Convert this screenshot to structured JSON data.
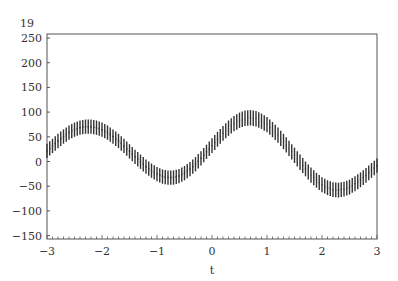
{
  "chart_data": {
    "type": "scatter",
    "title": "19",
    "xlabel": "t",
    "ylabel": "",
    "xlim": [
      -3,
      3
    ],
    "ylim": [
      -155,
      260
    ],
    "x_ticks": [
      -3,
      -2,
      -1,
      0,
      1,
      2,
      3
    ],
    "x_tick_labels": [
      "−3",
      "−2",
      "−1",
      "0",
      "1",
      "2",
      "3"
    ],
    "y_ticks": [
      250,
      200,
      150,
      100,
      50,
      0,
      -50,
      -100,
      -150
    ],
    "y_tick_labels": [
      "250",
      "200",
      "150",
      "100",
      "50",
      "0",
      "−50",
      "−100",
      "−150"
    ],
    "grid": false,
    "legend": null,
    "error_bars": true,
    "error_half_width": 8,
    "x": [
      -3.0,
      -2.9,
      -2.8,
      -2.7,
      -2.6,
      -2.5,
      -2.4,
      -2.3,
      -2.2,
      -2.1,
      -2.0,
      -1.9,
      -1.8,
      -1.7,
      -1.6,
      -1.5,
      -1.4,
      -1.3,
      -1.2,
      -1.1,
      -1.0,
      -0.9,
      -0.8,
      -0.7,
      -0.6,
      -0.5,
      -0.4,
      -0.3,
      -0.2,
      -0.1,
      0.0,
      0.1,
      0.2,
      0.3,
      0.4,
      0.5,
      0.6,
      0.7,
      0.8,
      0.9,
      1.0,
      1.1,
      1.2,
      1.3,
      1.4,
      1.5,
      1.6,
      1.7,
      1.8,
      1.9,
      2.0,
      2.1,
      2.2,
      2.3,
      2.4,
      2.5,
      2.6,
      2.7,
      2.8,
      2.9,
      3.0
    ],
    "series": [
      {
        "name": "upper",
        "values": [
          28,
          38,
          48,
          57,
          65,
          71,
          75,
          77,
          77,
          75,
          71,
          65,
          57,
          48,
          38,
          27,
          16,
          6,
          -4,
          -12,
          -19,
          -24,
          -26,
          -26,
          -23,
          -17,
          -9,
          1,
          13,
          26,
          39,
          52,
          64,
          75,
          84,
          91,
          95,
          96,
          94,
          89,
          82,
          72,
          61,
          48,
          34,
          20,
          6,
          -8,
          -20,
          -31,
          -40,
          -46,
          -50,
          -51,
          -49,
          -45,
          -38,
          -30,
          -21,
          -11,
          -2
        ]
      },
      {
        "name": "lower",
        "values": [
          15,
          25,
          35,
          44,
          52,
          58,
          62,
          64,
          64,
          62,
          58,
          52,
          44,
          35,
          25,
          14,
          3,
          -7,
          -17,
          -25,
          -32,
          -37,
          -39,
          -39,
          -36,
          -30,
          -22,
          -12,
          0,
          13,
          25,
          38,
          50,
          60,
          69,
          76,
          80,
          81,
          79,
          74,
          67,
          57,
          46,
          33,
          19,
          5,
          -9,
          -22,
          -35,
          -45,
          -54,
          -60,
          -64,
          -65,
          -63,
          -59,
          -52,
          -44,
          -35,
          -25,
          -15
        ]
      }
    ]
  }
}
